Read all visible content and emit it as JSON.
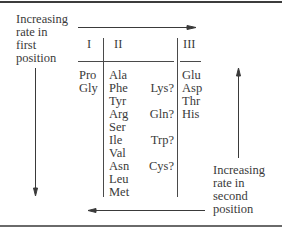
{
  "labels": {
    "first_position": [
      "Increasing",
      "rate in",
      "first",
      "position"
    ],
    "second_position": [
      "Increasing",
      "rate in",
      "second",
      "position"
    ]
  },
  "columns": [
    {
      "header": "I",
      "items": [
        "Pro",
        "Gly"
      ]
    },
    {
      "header": "II",
      "items": [
        "Ala",
        "Phe",
        "Tyr",
        "Arg",
        "Ser",
        "Ile",
        "Val",
        "Asn",
        "Leu",
        "Met"
      ]
    },
    {
      "header": "II_uncertain",
      "items": [
        "",
        "Lys?",
        "",
        "Gln?",
        "",
        "Trp?",
        "",
        "Cys?",
        "",
        ""
      ]
    },
    {
      "header": "III",
      "items": [
        "Glu",
        "Asp",
        "Thr",
        "His"
      ]
    }
  ],
  "arrows": {
    "top": "right",
    "left": "down",
    "right": "up",
    "bottom": "left"
  }
}
